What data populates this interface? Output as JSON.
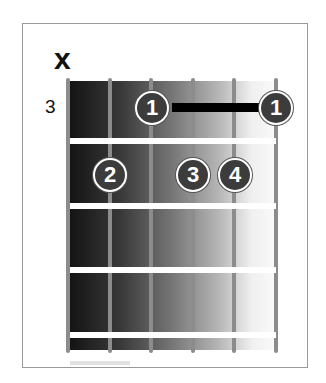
{
  "chord_diagram": {
    "muted_string_marker": "x",
    "base_fret_label": "3",
    "strings": 6,
    "frets_shown": 4,
    "barre": {
      "fret": 1,
      "from_string": 3,
      "to_string": 6,
      "finger": "1"
    },
    "fingers": [
      {
        "string": 3,
        "fret": 1,
        "label": "1"
      },
      {
        "string": 6,
        "fret": 1,
        "label": "1"
      },
      {
        "string": 2,
        "fret": 2,
        "label": "2"
      },
      {
        "string": 4,
        "fret": 2,
        "label": "3"
      },
      {
        "string": 5,
        "fret": 2,
        "label": "4"
      }
    ]
  }
}
